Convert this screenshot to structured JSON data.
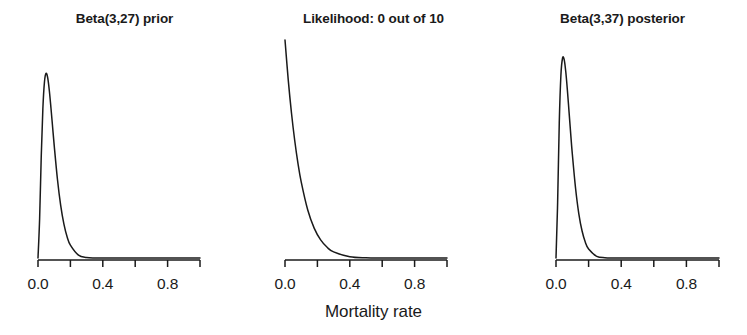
{
  "figure": {
    "background": "#ffffff",
    "line_color": "#1a1a1a",
    "axis_color": "#1a1a1a",
    "xlabel": "Mortality rate"
  },
  "chart_data": [
    {
      "type": "line",
      "title": "Beta(3,27) prior",
      "xlabel": "Mortality rate",
      "ylabel": "",
      "xlim": [
        0.0,
        1.0
      ],
      "ylim": [
        0,
        8.5
      ],
      "grid": false,
      "legend": "none",
      "distribution": "Beta",
      "alpha": 3,
      "beta": 27,
      "mode": 0.0714,
      "peak_density": 7.2,
      "xticks": [
        0.0,
        0.2,
        0.4,
        0.6,
        0.8
      ],
      "xticklabels": [
        "0.0",
        "",
        "0.4",
        "",
        "0.8"
      ],
      "x": [
        0.0,
        0.01,
        0.02,
        0.03,
        0.04,
        0.05,
        0.06,
        0.07,
        0.08,
        0.09,
        0.1,
        0.12,
        0.14,
        0.16,
        0.18,
        0.2,
        0.25,
        0.3,
        0.35,
        0.4,
        0.5,
        0.6,
        0.7,
        0.8,
        0.9,
        1.0
      ],
      "y": [
        0.0,
        1.53,
        3.96,
        5.82,
        6.87,
        7.2,
        7.02,
        6.52,
        5.85,
        5.12,
        4.39,
        3.07,
        2.05,
        1.32,
        0.82,
        0.5,
        0.11,
        0.02,
        0.003,
        0.0004,
        0.0,
        0.0,
        0.0,
        0.0,
        0.0,
        0.0
      ]
    },
    {
      "type": "line",
      "title": "Likelihood: 0 out of 10",
      "xlabel": "Mortality rate",
      "ylabel": "",
      "xlim": [
        0.0,
        1.0
      ],
      "ylim": [
        0,
        1.0
      ],
      "grid": false,
      "legend": "none",
      "distribution": "Binomial likelihood",
      "successes": 0,
      "trials": 10,
      "peak_density": 1.0,
      "xticks": [
        0.0,
        0.2,
        0.4,
        0.6,
        0.8
      ],
      "xticklabels": [
        "0.0",
        "",
        "0.4",
        "",
        "0.8"
      ],
      "x": [
        0.0,
        0.02,
        0.04,
        0.06,
        0.08,
        0.1,
        0.14,
        0.18,
        0.22,
        0.26,
        0.3,
        0.4,
        0.5,
        0.6,
        0.7,
        0.8,
        0.9,
        1.0
      ],
      "y": [
        1.0,
        0.817,
        0.665,
        0.539,
        0.434,
        0.349,
        0.221,
        0.137,
        0.083,
        0.049,
        0.028,
        0.006,
        0.001,
        0.0001,
        0.0,
        0.0,
        0.0,
        0.0
      ]
    },
    {
      "type": "line",
      "title": "Beta(3,37) posterior",
      "xlabel": "Mortality rate",
      "ylabel": "",
      "xlim": [
        0.0,
        1.0
      ],
      "ylim": [
        0,
        10.5
      ],
      "grid": false,
      "legend": "none",
      "distribution": "Beta",
      "alpha": 3,
      "beta": 37,
      "mode": 0.0526,
      "peak_density": 9.7,
      "xticks": [
        0.0,
        0.2,
        0.4,
        0.6,
        0.8
      ],
      "xticklabels": [
        "0.0",
        "",
        "0.4",
        "",
        "0.8"
      ],
      "x": [
        0.0,
        0.01,
        0.02,
        0.03,
        0.04,
        0.05,
        0.06,
        0.07,
        0.08,
        0.09,
        0.1,
        0.12,
        0.14,
        0.16,
        0.18,
        0.2,
        0.25,
        0.3,
        0.35,
        0.4,
        0.5,
        0.6,
        0.7,
        0.8,
        0.9,
        1.0
      ],
      "y": [
        0.0,
        2.68,
        6.49,
        8.79,
        9.62,
        9.57,
        8.97,
        8.07,
        7.04,
        6.0,
        5.02,
        3.36,
        2.13,
        1.3,
        0.76,
        0.43,
        0.08,
        0.012,
        0.0015,
        0.0001,
        0.0,
        0.0,
        0.0,
        0.0,
        0.0,
        0.0
      ]
    }
  ],
  "panels": [
    {
      "title": "Beta(3,27) prior",
      "ticks": [
        {
          "label": "0.0",
          "value": 0.0
        },
        {
          "label": "",
          "value": 0.2
        },
        {
          "label": "0.4",
          "value": 0.4
        },
        {
          "label": "",
          "value": 0.6
        },
        {
          "label": "0.8",
          "value": 0.8
        }
      ]
    },
    {
      "title": "Likelihood: 0 out of 10",
      "ticks": [
        {
          "label": "0.0",
          "value": 0.0
        },
        {
          "label": "",
          "value": 0.2
        },
        {
          "label": "0.4",
          "value": 0.4
        },
        {
          "label": "",
          "value": 0.6
        },
        {
          "label": "0.8",
          "value": 0.8
        }
      ]
    },
    {
      "title": "Beta(3,37) posterior",
      "ticks": [
        {
          "label": "0.0",
          "value": 0.0
        },
        {
          "label": "",
          "value": 0.2
        },
        {
          "label": "0.4",
          "value": 0.4
        },
        {
          "label": "",
          "value": 0.6
        },
        {
          "label": "0.8",
          "value": 0.8
        }
      ]
    }
  ]
}
